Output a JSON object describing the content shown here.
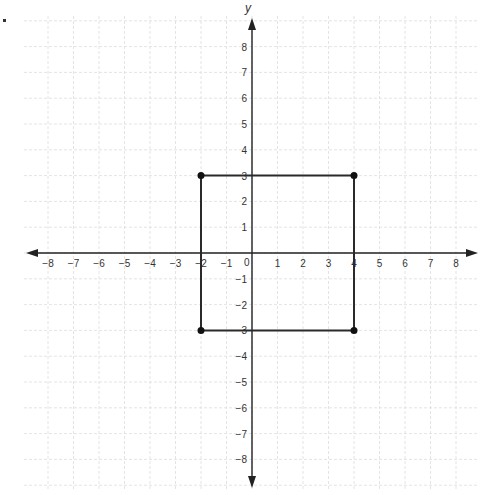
{
  "chart_data": {
    "type": "scatter",
    "title": "",
    "xlabel": "",
    "ylabel": "y",
    "xlim": [
      -9,
      9
    ],
    "ylim": [
      -9,
      9
    ],
    "grid": true,
    "x_ticks": [
      -8,
      -7,
      -6,
      -5,
      -4,
      -3,
      -2,
      -1,
      1,
      2,
      3,
      4,
      5,
      6,
      7,
      8
    ],
    "y_ticks": [
      8,
      7,
      6,
      5,
      4,
      3,
      2,
      1,
      -1,
      -2,
      -3,
      -4,
      -5,
      -6,
      -7,
      -8
    ],
    "origin_label": "0",
    "series": [
      {
        "name": "rectangle",
        "shape": "closed-polygon",
        "points": [
          {
            "x": -2,
            "y": 3
          },
          {
            "x": 4,
            "y": 3
          },
          {
            "x": 4,
            "y": -3
          },
          {
            "x": -2,
            "y": -3
          }
        ]
      }
    ]
  },
  "colors": {
    "axis": "#222222",
    "grid": "#dddddd",
    "shape": "#2a2a2a",
    "tick_label": "#333333"
  }
}
